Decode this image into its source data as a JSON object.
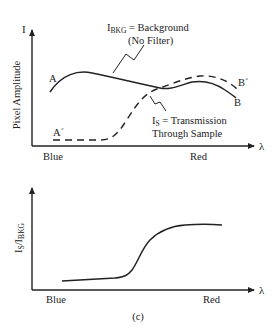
{
  "top_graph": {
    "y_axis_symbol": "I",
    "y_axis_label": "Pixel Amplitude",
    "x_axis_symbol": "λ",
    "x_left_label": "Blue",
    "x_right_label": "Red",
    "background_curve": {
      "label_main": "I",
      "label_sub": "BKG",
      "label_rest": " = Background",
      "label_line2": "(No Filter)",
      "start_label": "A",
      "end_label": "B"
    },
    "sample_curve": {
      "label_main": "I",
      "label_sub": "S",
      "label_rest": " = Transmission",
      "label_line2": "Through Sample",
      "start_label": "A´",
      "end_label": "B´"
    }
  },
  "bottom_graph": {
    "y_axis_label_main": "I",
    "y_axis_label_sub1": "S",
    "y_axis_label_slash": "/I",
    "y_axis_label_sub2": "BKG",
    "x_axis_symbol": "λ",
    "x_left_label": "Blue",
    "x_right_label": "Red"
  },
  "caption": "(c)",
  "colors": {
    "ink": "#222222",
    "background": "#ffffff"
  }
}
